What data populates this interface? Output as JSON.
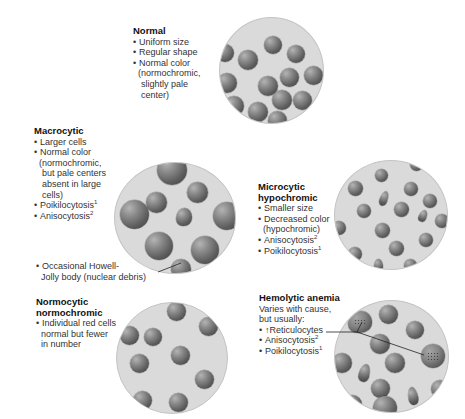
{
  "panels": {
    "normal": {
      "title": "Normal",
      "lines": [
        "Uniform size",
        "Regular shape",
        "Normal color",
        "(normochromic,",
        "slightly pale",
        "center)"
      ]
    },
    "macrocytic": {
      "title": "Macrocytic",
      "lines": [
        "Larger cells",
        "Normal color",
        "(normochromic,",
        "but pale centers",
        "absent in large",
        "cells)",
        "Poikilocytosis",
        "Anisocytosis"
      ],
      "sup_poikilocytosis": "1",
      "sup_anisocytosis": "2",
      "callout_line1": "Occasional Howell-",
      "callout_line2": "Jolly body (nuclear debris)"
    },
    "microcytic": {
      "title_line1": "Microcytic",
      "title_line2": "hypochromic",
      "lines": [
        "Smaller size",
        "Decreased color",
        "(hypochromic)",
        "Anisocytosis",
        "Poikilocytosis"
      ],
      "sup_anisocytosis": "2",
      "sup_poikilocytosis": "1"
    },
    "normocytic": {
      "title_line1": "Normocytic",
      "title_line2": "normochromic",
      "lines": [
        "Individual red cells",
        "normal but fewer",
        "in number"
      ]
    },
    "hemolytic": {
      "title": "Hemolytic anemia",
      "intro_line1": "Varies with cause,",
      "intro_line2": "but usually:",
      "lines": [
        "↑Reticulocytes",
        "Anisocytosis",
        "Poikilocytosis"
      ],
      "sup_anisocytosis": "2",
      "sup_poikilocytosis": "1"
    }
  },
  "bullet": "•",
  "colors": {
    "dish_fill": "#dadada",
    "dish_border": "#c4c4c4",
    "cell_dark": "#3e3e3e",
    "cell_light": "#b4b4b4",
    "text": "#333333"
  }
}
